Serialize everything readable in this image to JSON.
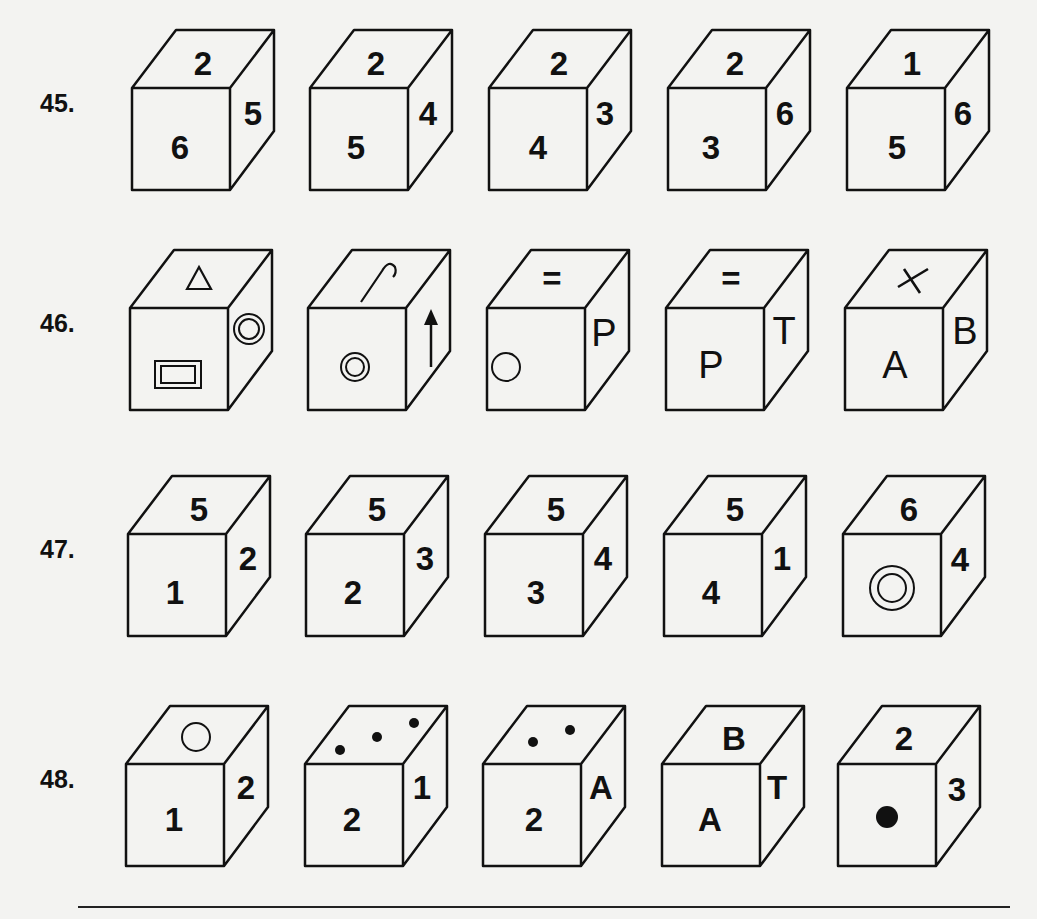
{
  "questions": [
    {
      "number": "45.",
      "cubes": [
        {
          "top": "2",
          "front": "6",
          "right": "5"
        },
        {
          "top": "2",
          "front": "5",
          "right": "4"
        },
        {
          "top": "2",
          "front": "4",
          "right": "3"
        },
        {
          "top": "2",
          "front": "3",
          "right": "6"
        },
        {
          "top": "1",
          "front": "5",
          "right": "6"
        }
      ]
    },
    {
      "number": "46.",
      "cubes": [
        {
          "top": "triangle-outline",
          "front": "double-rectangle",
          "right": "double-circle"
        },
        {
          "top": "hook-line",
          "front": "double-circle",
          "right": "up-arrow"
        },
        {
          "top": "=",
          "front": "circle-outline",
          "right": "P"
        },
        {
          "top": "=",
          "front": "P",
          "right": "T"
        },
        {
          "top": "✕",
          "front": "A",
          "right": "B"
        }
      ]
    },
    {
      "number": "47.",
      "cubes": [
        {
          "top": "5",
          "front": "1",
          "right": "2"
        },
        {
          "top": "5",
          "front": "2",
          "right": "3"
        },
        {
          "top": "5",
          "front": "3",
          "right": "4"
        },
        {
          "top": "5",
          "front": "4",
          "right": "1"
        },
        {
          "top": "6",
          "front": "double-circle",
          "right": "4"
        }
      ]
    },
    {
      "number": "48.",
      "cubes": [
        {
          "top": "circle-outline",
          "front": "1",
          "right": "2"
        },
        {
          "top": "three-dots",
          "front": "2",
          "right": "1"
        },
        {
          "top": "two-dots",
          "front": "2",
          "right": "A"
        },
        {
          "top": "B",
          "front": "A",
          "right": "T"
        },
        {
          "top": "2",
          "front": "filled-dot",
          "right": "3"
        }
      ]
    }
  ]
}
